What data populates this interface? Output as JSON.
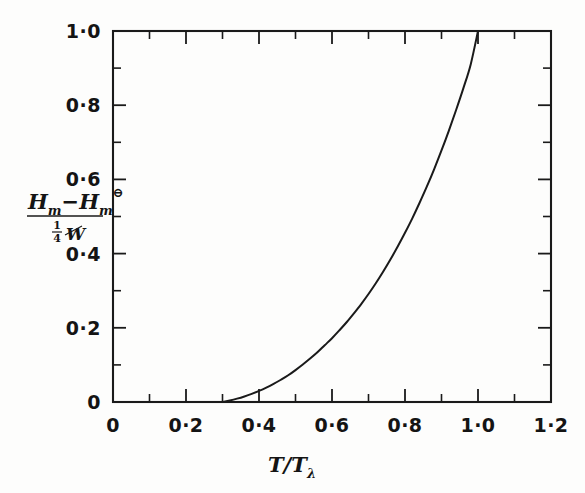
{
  "chart_data": {
    "type": "line",
    "title": "",
    "subtitle": "",
    "xlabel": "T/Tλ",
    "xlabel_main": "T/T",
    "xlabel_sub": "λ",
    "ylabel": "(Hₘ − Hₘ^⊖) / (¼W)",
    "ylabel_num_a": "H",
    "ylabel_num_a_sub": "m",
    "ylabel_minus": "−",
    "ylabel_num_b": "H",
    "ylabel_num_b_sub": "m",
    "ylabel_num_b_sup": "⊖",
    "ylabel_den_frac_num": "1",
    "ylabel_den_frac_den": "4",
    "ylabel_den_sym": "W",
    "xlim": [
      0,
      1.2
    ],
    "ylim": [
      0,
      1.0
    ],
    "grid": false,
    "legend": "none",
    "x_major_ticks": [
      0,
      0.2,
      0.4,
      0.6,
      0.8,
      1.0,
      1.2
    ],
    "x_major_labels": [
      "0",
      "0·2",
      "0·4",
      "0·6",
      "0·8",
      "1·0",
      "1·2"
    ],
    "x_minor_ticks": [
      0.1,
      0.3,
      0.5,
      0.7,
      0.9,
      1.1
    ],
    "y_major_ticks": [
      0,
      0.2,
      0.4,
      0.6,
      0.8,
      1.0
    ],
    "y_major_labels": [
      "0",
      "0·2",
      "0·4",
      "0·6",
      "0·8",
      "1·0"
    ],
    "y_minor_ticks": [
      0.1,
      0.3,
      0.5,
      0.7,
      0.9
    ],
    "curve_start_x": 0.3,
    "curve_end_x": 1.0,
    "series": [
      {
        "name": "reduced enthalpy",
        "x": [
          0.3,
          0.32,
          0.34,
          0.36,
          0.38,
          0.4,
          0.42,
          0.44,
          0.46,
          0.48,
          0.5,
          0.52,
          0.54,
          0.56,
          0.58,
          0.6,
          0.62,
          0.64,
          0.66,
          0.68,
          0.7,
          0.72,
          0.74,
          0.76,
          0.78,
          0.8,
          0.82,
          0.84,
          0.86,
          0.88,
          0.9,
          0.92,
          0.94,
          0.96,
          0.98,
          1.0
        ],
        "y": [
          0.0,
          0.004,
          0.009,
          0.015,
          0.022,
          0.03,
          0.039,
          0.049,
          0.06,
          0.072,
          0.086,
          0.101,
          0.117,
          0.134,
          0.153,
          0.172,
          0.193,
          0.215,
          0.239,
          0.264,
          0.291,
          0.32,
          0.351,
          0.384,
          0.419,
          0.456,
          0.495,
          0.537,
          0.581,
          0.628,
          0.678,
          0.731,
          0.787,
          0.846,
          0.91,
          1.0
        ]
      }
    ]
  },
  "figure": {
    "background_color": "#fdfdfc",
    "line_color": "#1a1a1a",
    "axis_color": "#1a1a1a"
  }
}
